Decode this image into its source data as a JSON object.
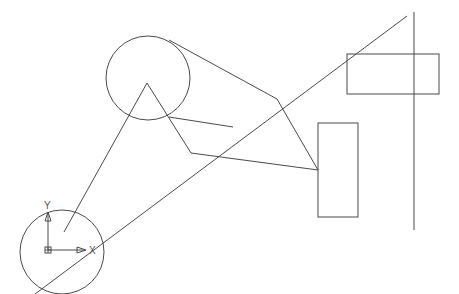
{
  "drawing": {
    "background": "#ffffff",
    "stroke_color": "#4a4a4a",
    "circles": [
      {
        "name": "upper-circle",
        "cx": 148,
        "cy": 78,
        "r": 42
      },
      {
        "name": "lower-circle",
        "cx": 62,
        "cy": 252,
        "r": 42
      }
    ],
    "rectangles": [
      {
        "name": "upper-right-rectangle",
        "x": 347,
        "y": 54,
        "w": 92,
        "h": 40
      },
      {
        "name": "middle-rectangle",
        "x": 318,
        "y": 123,
        "w": 40,
        "h": 94
      }
    ],
    "lines": [
      {
        "name": "long-diagonal",
        "x1": 35,
        "y1": 294,
        "x2": 407,
        "y2": 16
      },
      {
        "name": "vertical-line",
        "x1": 414,
        "y1": 12,
        "x2": 414,
        "y2": 230
      },
      {
        "name": "triangle-left-edge",
        "x1": 64,
        "y1": 232,
        "x2": 147,
        "y2": 83
      },
      {
        "name": "triangle-right-edge",
        "x1": 147,
        "y1": 83,
        "x2": 191,
        "y2": 153
      },
      {
        "name": "tangent-upper",
        "x1": 169,
        "y1": 40,
        "x2": 277,
        "y2": 99
      },
      {
        "name": "node-a-to-rect",
        "x1": 277,
        "y1": 99,
        "x2": 318,
        "y2": 170
      },
      {
        "name": "circle-to-diagonal",
        "x1": 169,
        "y1": 117,
        "x2": 233,
        "y2": 127
      },
      {
        "name": "node-b-to-rect",
        "x1": 191,
        "y1": 153,
        "x2": 318,
        "y2": 170
      },
      {
        "name": "lower-circle-ray",
        "x1": 62,
        "y1": 234,
        "x2": 191,
        "y2": 153
      }
    ],
    "ucs_icon": {
      "origin_x": 48,
      "origin_y": 250,
      "x_label": "X",
      "y_label": "Y"
    }
  }
}
